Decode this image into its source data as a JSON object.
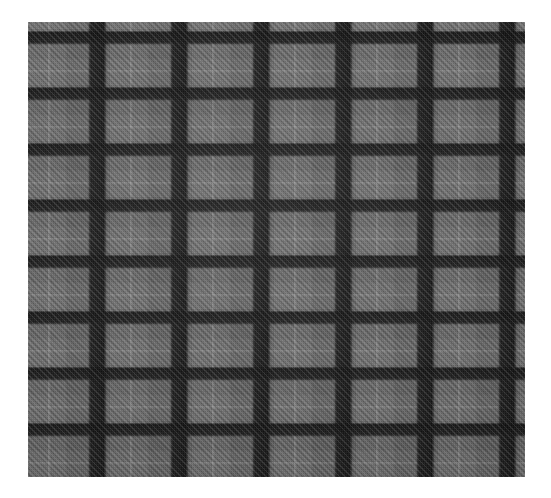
{
  "page": {
    "title": "Tartan Fabric Swatch",
    "type": "photograph",
    "canvas": {
      "width": 551,
      "height": 498,
      "background": "#ffffff"
    }
  },
  "swatch": {
    "label": "Grey tartan plaid fabric swatch",
    "bounds": {
      "left": 28,
      "top": 22,
      "width": 497,
      "height": 455
    },
    "weave": {
      "type": "twill",
      "angle_degrees": 45,
      "direction": "lower-left to upper-right",
      "thread_pitch_px": 4
    },
    "colors": {
      "ground_grey": "#5b5b5b",
      "light_block_grey": "#6a6a6a",
      "mid_block_grey": "#616161",
      "dark_bar_black": "#141414",
      "intersection_black": "#0e0e0e",
      "pinstripe_light": "#d0d0d0",
      "page_background": "#ffffff"
    },
    "sett": {
      "warp_period_px": 82,
      "warp_dark_bar_width_px": 19,
      "weft_period_px": 56,
      "weft_dark_bar_width_px": 14,
      "overcheck_pinstripe_spacing_x_px": 41,
      "overcheck_pinstripe_spacing_y_px": 28,
      "warp_dark_stripe_count": 6,
      "weft_dark_stripe_count": 8
    }
  }
}
